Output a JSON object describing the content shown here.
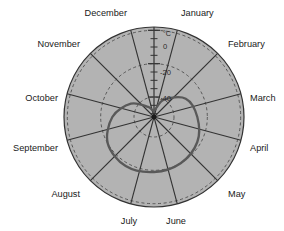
{
  "chart_data": {
    "type": "line",
    "polar": true,
    "title": "",
    "subtitle": "",
    "xlabel": "",
    "ylabel": "",
    "unit_label": "°C",
    "categories": [
      "January",
      "February",
      "March",
      "April",
      "May",
      "June",
      "July",
      "August",
      "September",
      "October",
      "November",
      "December"
    ],
    "angles_deg": [
      0,
      30,
      60,
      90,
      120,
      150,
      180,
      210,
      240,
      270,
      300,
      330
    ],
    "radial_ticks": [
      0,
      -20,
      -40
    ],
    "radial_tick_labels": [
      "0",
      "-20",
      "-40"
    ],
    "rlim": [
      -52,
      2
    ],
    "grid": true,
    "grid_style": "dashed",
    "legend": "none",
    "series": [
      {
        "name": "Mean monthly temperature",
        "values": [
          -48,
          -40,
          -30,
          -26,
          -22,
          -20,
          -19,
          -18,
          -20,
          -27,
          -36,
          -45
        ]
      }
    ],
    "values_by_month": {
      "January": -48,
      "February": -40,
      "March": -30,
      "April": -26,
      "May": -22,
      "June": -20,
      "July": -19,
      "August": -18,
      "September": -20,
      "October": -27,
      "November": -36,
      "December": -45
    }
  },
  "colors": {
    "plot_background": "#b3b3b3",
    "grid_line": "#4d4d4d",
    "axis_line": "#333333",
    "series_line": "#595959",
    "page_background": "#ffffff",
    "text": "#1a1a1a"
  },
  "labels": {
    "months": [
      "January",
      "February",
      "March",
      "April",
      "May",
      "June",
      "July",
      "August",
      "September",
      "October",
      "November",
      "December"
    ],
    "radial": [
      "0",
      "-20",
      "-40"
    ],
    "unit": "°C"
  }
}
